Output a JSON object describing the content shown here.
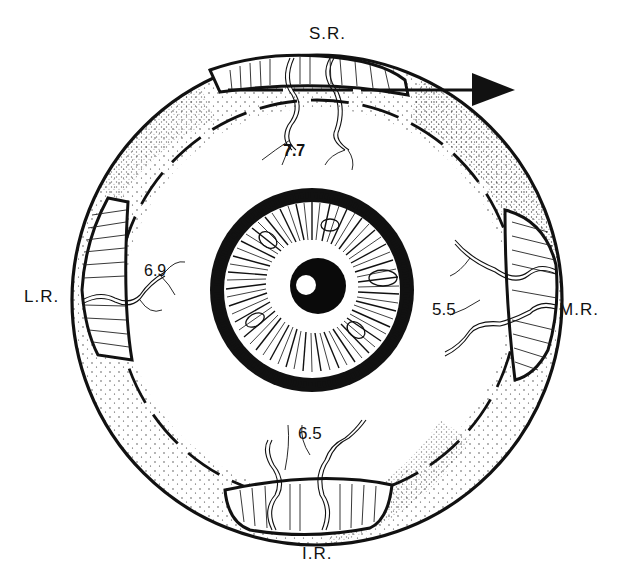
{
  "diagram": {
    "colors": {
      "ink": "#111111",
      "paper": "#ffffff",
      "stipple": "#333333"
    },
    "muscles": [
      {
        "id": "sr",
        "label": "S.R.",
        "distance": "7.7"
      },
      {
        "id": "lr",
        "label": "L.R.",
        "distance": "6.9"
      },
      {
        "id": "mr",
        "label": "M.R.",
        "distance": "5.5"
      },
      {
        "id": "ir",
        "label": "I.R.",
        "distance": "6.5"
      }
    ],
    "arrow": {
      "direction": "right"
    }
  }
}
